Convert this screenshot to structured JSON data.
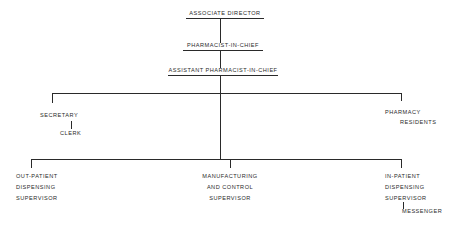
{
  "nodes": {
    "associate_director": "ASSOCIATE DIRECTOR",
    "pharmacist_in_chief": "PHARMACIST-IN-CHIEF",
    "assistant_pharmacist_in_chief": "ASSISTANT PHARMACIST-IN-CHIEF",
    "secretary": "SECRETARY",
    "clerk": "CLERK",
    "pharmacy_residents": [
      "PHARMACY",
      "RESIDENTS"
    ],
    "out_patient": [
      "OUT-PATIENT",
      "DISPENSING",
      "SUPERVISOR"
    ],
    "manufacturing": [
      "MANUFACTURING",
      "AND CONTROL",
      "SUPERVISOR"
    ],
    "in_patient": [
      "IN-PATIENT",
      "DISPENSING",
      "SUPERVISOR"
    ],
    "messenger": "MESSENGER"
  },
  "colors": {
    "line": "#2a2a2a",
    "background": "#ffffff"
  }
}
